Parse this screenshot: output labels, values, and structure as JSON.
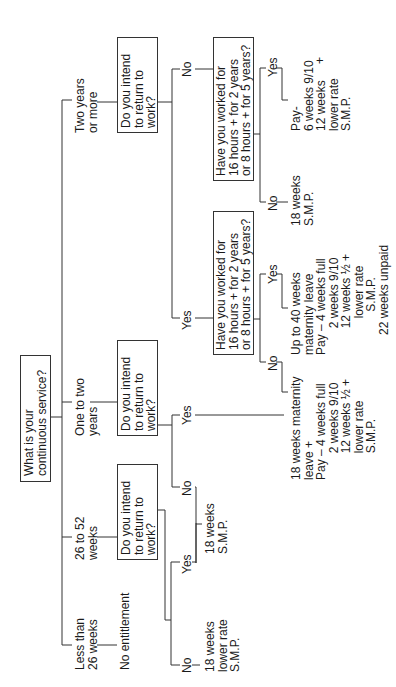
{
  "root": {
    "question": "What is your\ncontinuous service?"
  },
  "branches": {
    "two_plus": {
      "label": "Two years\nor more",
      "question": "Do you intend\nto return to\nwork?",
      "no": {
        "label": "No",
        "question": "Have you worked for\n16 hours + for 2 years\nor 8 hours + for 5 years?",
        "yes": {
          "label": "Yes",
          "outcome": "Pay-\n6 weeks 9/10\n12 weeks\nlower rate\nS.M.P.",
          "plus": "+"
        },
        "no": {
          "label": "No",
          "outcome": "18 weeks\nS.M.P."
        }
      },
      "yes": {
        "label": "Yes",
        "question": "Have you worked for\n16 hours + for 2 years\nor 8 hours + for 5 years?",
        "yes": {
          "label": "Yes",
          "outcome": "Up to 40 weeks\nmaternity leave\nPay – 4 weeks full\n        2 weeks 9/10\n        12 weeks ½ +\n           lower rate\n             S.M.P.\n      22 weeks unpaid"
        },
        "no": {
          "label": "No",
          "outcome": "18 weeks maternity\nleave +\nPay – 4 weeks full\n        2 weeks 9/10\n        12 weeks ½ +\n        lower rate\n        S.M.P."
        }
      }
    },
    "one_two": {
      "label": "One to two\nyears",
      "question": "Do you intend\nto return to\nwork?",
      "yes": {
        "label": "Yes"
      },
      "no": {
        "label": "No",
        "outcome": "18 weeks\nS.M.P."
      }
    },
    "weeks_26_52": {
      "label": "26 to 52\nweeks",
      "question": "Do you intend\nto return to\nwork?",
      "yes": {
        "label": "Yes"
      },
      "no": {
        "label": "No",
        "outcome": "18 weeks\nlower rate\nS.M.P."
      }
    },
    "less_26": {
      "label": "Less than\n26 weeks",
      "outcome": "No entitlement"
    }
  }
}
